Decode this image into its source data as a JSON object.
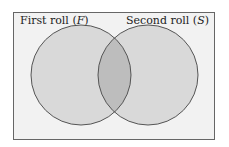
{
  "diagram": {
    "type": "venn",
    "sets": [
      {
        "label": "First roll",
        "symbol": "F"
      },
      {
        "label": "Second roll",
        "symbol": "S"
      }
    ],
    "colors": {
      "background": "#f2f2f2",
      "circle_fill": "#d9d9d9",
      "intersection_fill": "#bdbdbd",
      "stroke": "#555555"
    }
  }
}
